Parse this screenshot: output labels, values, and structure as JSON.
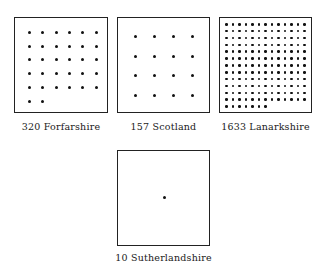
{
  "panels": [
    {
      "id": "forfarshire",
      "count": "320",
      "name": "Forfarshire",
      "dots": 32,
      "cols": 6,
      "box": {
        "x": 14,
        "y": 17,
        "w": 94,
        "h": 96
      },
      "grid": {
        "x0": 28,
        "y0": 31,
        "dx": 13.3,
        "dy": 13.7
      },
      "label": {
        "x": 14,
        "y": 121,
        "w": 94
      }
    },
    {
      "id": "scotland",
      "count": "157",
      "name": "Scotland",
      "dots": 16,
      "cols": 4,
      "box": {
        "x": 117,
        "y": 17,
        "w": 93,
        "h": 96
      },
      "grid": {
        "x0": 134,
        "y0": 35,
        "dx": 19,
        "dy": 19.5
      },
      "label": {
        "x": 117,
        "y": 121,
        "w": 93
      }
    },
    {
      "id": "lanarkshire",
      "count": "1633",
      "name": "Lanarkshire",
      "dots": 163,
      "cols": 13,
      "box": {
        "x": 219,
        "y": 17,
        "w": 93,
        "h": 96
      },
      "grid": {
        "x0": 225,
        "y0": 23,
        "dx": 6.5,
        "dy": 6.85
      },
      "label": {
        "x": 219,
        "y": 121,
        "w": 93
      }
    },
    {
      "id": "sutherlandshire",
      "count": "10",
      "name": "Sutherlandshire",
      "dots": 1,
      "cols": 1,
      "box": {
        "x": 117,
        "y": 150,
        "w": 93,
        "h": 96
      },
      "grid": {
        "x0": 162.5,
        "y0": 196,
        "dx": 0,
        "dy": 0
      },
      "label": {
        "x": 107,
        "y": 252,
        "w": 113
      }
    }
  ],
  "labels": {
    "forfarshire": "320  Forfarshire",
    "scotland": "157  Scotland",
    "lanarkshire": "1633  Lanarkshire",
    "sutherlandshire": "10  Sutherlandshire"
  }
}
